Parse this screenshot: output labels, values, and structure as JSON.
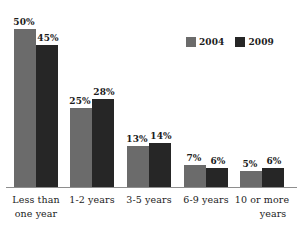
{
  "chart_data": {
    "type": "bar",
    "title": "",
    "subtitle": "",
    "xlabel": "",
    "ylabel": "",
    "grid": false,
    "legend_position": "top-right",
    "ylim": [
      0,
      50
    ],
    "value_suffix": "%",
    "categories": [
      "Less than one year",
      "1-2 years",
      "3-5 years",
      "6-9 years",
      "10 or more years"
    ],
    "category_lines": [
      [
        "Less than",
        "one year"
      ],
      [
        "1-2 years",
        ""
      ],
      [
        "3-5 years",
        ""
      ],
      [
        "6-9 years",
        ""
      ],
      [
        "10 or more",
        "years"
      ]
    ],
    "series": [
      {
        "name": "2004",
        "color": "#6b6b6b",
        "values": [
          50,
          25,
          13,
          7,
          5
        ],
        "labels": [
          "50%",
          "25%",
          "13%",
          "7%",
          "5%"
        ]
      },
      {
        "name": "2009",
        "color": "#262626",
        "values": [
          45,
          28,
          14,
          6,
          6
        ],
        "labels": [
          "45%",
          "28%",
          "14%",
          "6%",
          "6%"
        ]
      }
    ]
  },
  "legend": {
    "items": [
      {
        "label": "2004",
        "color": "#6b6b6b"
      },
      {
        "label": "2009",
        "color": "#262626"
      }
    ]
  },
  "axis": {
    "baseline_color": "#8e8e8e"
  }
}
